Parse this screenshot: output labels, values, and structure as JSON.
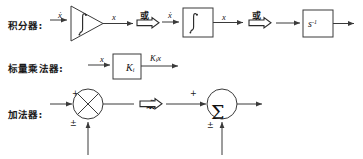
{
  "diagram": {
    "background_color": "#ffffff",
    "line_color": "#3a3a3a",
    "text_color": "#1a1a1a",
    "or_label": "或",
    "rows": [
      {
        "id": "integrator",
        "label": "积分器:",
        "variants": [
          {
            "id": "triangle-integrator",
            "shape": "triangle",
            "inner_symbol": "∫",
            "input_label": "ẋ",
            "output_label": "x"
          },
          {
            "id": "box-integrator",
            "shape": "box",
            "inner_symbol": "∫",
            "input_label": "ẋ",
            "output_label": "x"
          },
          {
            "id": "laplace-integrator",
            "shape": "box",
            "inner_symbol": "s",
            "inner_exponent": "-1",
            "input_label": "",
            "output_label": ""
          }
        ]
      },
      {
        "id": "scalar-multiplier",
        "label": "标量乘法器:",
        "variants": [
          {
            "id": "gain-box",
            "shape": "box",
            "inner_symbol": "K",
            "inner_subscript": "i",
            "input_label": "x",
            "output_label": "K",
            "output_subscript": "i",
            "output_suffix": "x"
          }
        ]
      },
      {
        "id": "adder",
        "label": "加法器:",
        "variants": [
          {
            "id": "cross-summer",
            "shape": "circle-cross",
            "inner_symbol": "",
            "top_sign": "+",
            "bottom_sign": "±"
          },
          {
            "id": "sigma-summer",
            "shape": "circle-sigma",
            "inner_symbol": "Σ",
            "top_sign": "+",
            "bottom_sign": "±"
          }
        ]
      }
    ]
  }
}
